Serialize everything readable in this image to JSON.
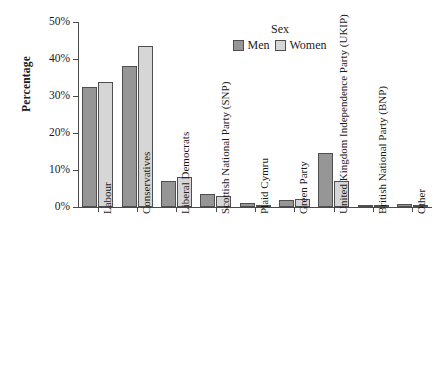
{
  "chart_data": {
    "type": "bar",
    "title": "",
    "xlabel": "",
    "ylabel": "Percentage",
    "ylim": [
      0,
      50
    ],
    "yticks": [
      0,
      10,
      20,
      30,
      40,
      50
    ],
    "ytick_labels": [
      "0%",
      "10%",
      "20%",
      "30%",
      "40%",
      "50%"
    ],
    "grid": false,
    "legend": {
      "title": "Sex",
      "position": "top-center",
      "entries": [
        {
          "name": "Men",
          "color": "#969696"
        },
        {
          "name": "Women",
          "color": "#d6d6d6"
        }
      ]
    },
    "categories": [
      "Labour",
      "Conservatives",
      "Liberal Democrats",
      "Scottish National Party (SNP)",
      "Plaid Cymru",
      "Green Party",
      "United Kingdom Independence Party (UKIP)",
      "British National Party (BNP)",
      "Other"
    ],
    "series": [
      {
        "name": "Men",
        "color": "#969696",
        "values": [
          32.4,
          38.1,
          7.1,
          3.5,
          1.2,
          1.9,
          14.6,
          0.1,
          0.8
        ]
      },
      {
        "name": "Women",
        "color": "#d6d6d6",
        "values": [
          33.9,
          43.5,
          8.1,
          3.0,
          0.5,
          2.2,
          6.9,
          0.1,
          0.4
        ]
      }
    ]
  },
  "caption": ""
}
